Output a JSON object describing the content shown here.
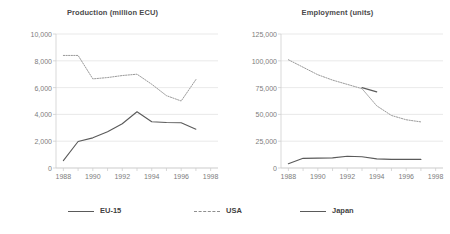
{
  "legend": {
    "items": [
      {
        "label": "EU-15",
        "style": "solid",
        "color": "#5a5a5a"
      },
      {
        "label": "USA",
        "style": "dashed",
        "color": "#8f8f8f"
      },
      {
        "label": "Japan",
        "style": "solid",
        "color": "#5a5a5a"
      }
    ]
  },
  "chart_data": [
    {
      "type": "line",
      "title": "Production (million ECU)",
      "xlabel": "",
      "ylabel": "",
      "xlim": [
        1987.5,
        1998.5
      ],
      "ylim": [
        0,
        10000
      ],
      "yticks": [
        0,
        2000,
        4000,
        6000,
        8000,
        10000
      ],
      "yticklabels": [
        "0",
        "2,000",
        "4,000",
        "6,000",
        "8,000",
        "10,000"
      ],
      "xticks": [
        1988,
        1990,
        1992,
        1994,
        1996,
        1998
      ],
      "xticklabels": [
        "1988",
        "1990",
        "1992",
        "1994",
        "1996",
        "1998"
      ],
      "grid": "horizontal",
      "legend_position": "below-figure",
      "series": [
        {
          "name": "EU-15",
          "style": "solid",
          "color": "#5a5a5a",
          "x": [
            1988,
            1989,
            1990,
            1991,
            1992,
            1993,
            1994,
            1995,
            1996,
            1997
          ],
          "values": [
            550,
            1980,
            2250,
            2700,
            3300,
            4200,
            3450,
            3400,
            3380,
            2900
          ]
        },
        {
          "name": "USA",
          "style": "dashed",
          "color": "#9a9a9a",
          "x": [
            1988,
            1989,
            1990,
            1991,
            1992,
            1993,
            1994,
            1995,
            1996,
            1997
          ],
          "values": [
            8400,
            8400,
            6650,
            6750,
            6900,
            7000,
            6250,
            5400,
            5000,
            6600
          ]
        }
      ]
    },
    {
      "type": "line",
      "title": "Employment (units)",
      "xlabel": "",
      "ylabel": "",
      "xlim": [
        1987.5,
        1998.5
      ],
      "ylim": [
        0,
        125000
      ],
      "yticks": [
        0,
        25000,
        50000,
        75000,
        100000,
        125000
      ],
      "yticklabels": [
        "0",
        "25,000",
        "50,000",
        "75,000",
        "100,000",
        "125,000"
      ],
      "xticks": [
        1988,
        1990,
        1992,
        1994,
        1996,
        1998
      ],
      "xticklabels": [
        "1988",
        "1990",
        "1992",
        "1994",
        "1996",
        "1998"
      ],
      "grid": "horizontal",
      "legend_position": "below-figure",
      "series": [
        {
          "name": "EU-15",
          "style": "solid",
          "color": "#5a5a5a",
          "x": [
            1993,
            1994
          ],
          "values": [
            75000,
            71000
          ]
        },
        {
          "name": "USA",
          "style": "dashed",
          "color": "#9a9a9a",
          "x": [
            1988,
            1989,
            1990,
            1991,
            1992,
            1993,
            1994,
            1995,
            1996,
            1997
          ],
          "values": [
            101000,
            94000,
            87000,
            82000,
            78000,
            74000,
            58000,
            49000,
            45000,
            43000
          ]
        },
        {
          "name": "Japan",
          "style": "solid",
          "color": "#5a5a5a",
          "x": [
            1988,
            1989,
            1990,
            1991,
            1992,
            1993,
            1994,
            1995,
            1996,
            1997
          ],
          "values": [
            4000,
            9000,
            9200,
            9400,
            11000,
            10500,
            8500,
            8000,
            8000,
            8000
          ]
        }
      ]
    }
  ]
}
